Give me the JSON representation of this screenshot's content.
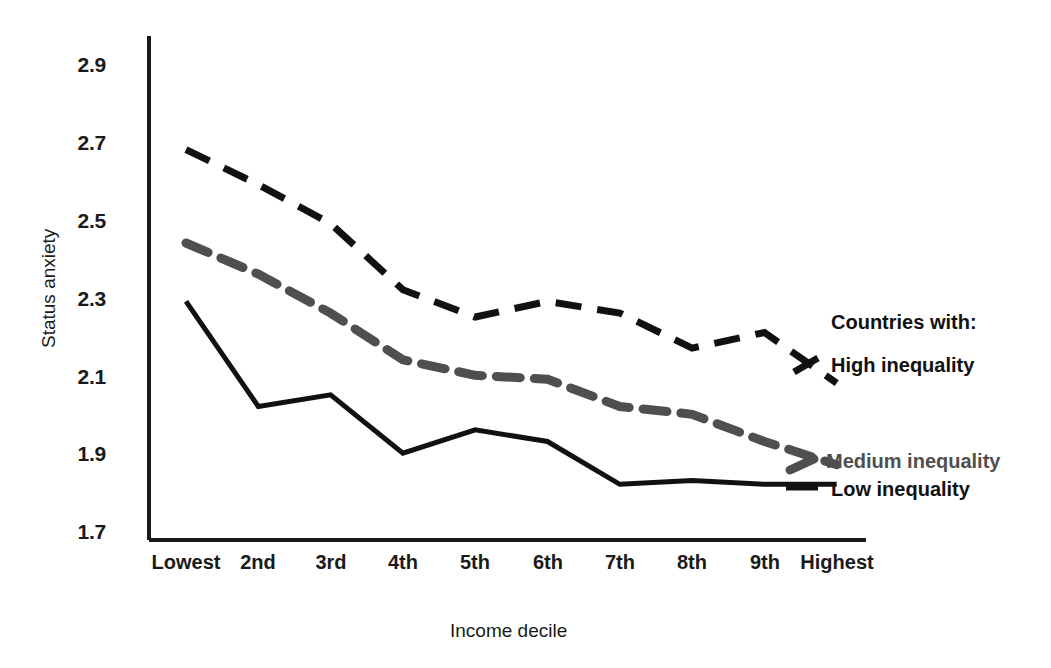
{
  "chart_data": {
    "type": "line",
    "title": "",
    "xlabel": "Income decile",
    "ylabel": "Status anxiety",
    "categories": [
      "Lowest",
      "2nd",
      "3rd",
      "4th",
      "5th",
      "6th",
      "7th",
      "8th",
      "9th",
      "Highest"
    ],
    "ylim": [
      1.7,
      2.9
    ],
    "yticks": [
      "1.7",
      "1.9",
      "2.1",
      "2.3",
      "2.5",
      "2.7",
      "2.9"
    ],
    "ytick_values": [
      1.7,
      1.9,
      2.1,
      2.3,
      2.5,
      2.7,
      2.9
    ],
    "grid": false,
    "legend_position": "right",
    "legend_heading": "Countries with:",
    "series": [
      {
        "name": "High inequality",
        "style": "dashed",
        "color": "#111111",
        "values": [
          2.68,
          2.59,
          2.49,
          2.32,
          2.25,
          2.29,
          2.26,
          2.17,
          2.21,
          2.08
        ]
      },
      {
        "name": "Medium inequality",
        "style": "dashed",
        "color": "#4f4f4f",
        "values": [
          2.44,
          2.36,
          2.26,
          2.14,
          2.1,
          2.09,
          2.02,
          2.0,
          1.93,
          1.87
        ]
      },
      {
        "name": "Low inequality",
        "style": "solid",
        "color": "#111111",
        "values": [
          2.29,
          2.02,
          2.05,
          1.9,
          1.96,
          1.93,
          1.82,
          1.83,
          1.82,
          1.82
        ]
      }
    ]
  },
  "axes": {
    "y_title": "Status anxiety",
    "x_title": "Income decile"
  },
  "ticks": {
    "y": [
      "2.9",
      "2.7",
      "2.5",
      "2.3",
      "2.1",
      "1.9",
      "1.7"
    ],
    "x": [
      "Lowest",
      "2nd",
      "3rd",
      "4th",
      "5th",
      "6th",
      "7th",
      "8th",
      "9th",
      "Highest"
    ]
  },
  "legend": {
    "heading": "Countries with:",
    "high": "High inequality",
    "medium": "Medium inequality",
    "low": "Low inequality"
  },
  "colors": {
    "high": "#111111",
    "medium": "#4f4f4f",
    "low": "#111111",
    "axis": "#1a1a1a",
    "background": "#ffffff"
  }
}
